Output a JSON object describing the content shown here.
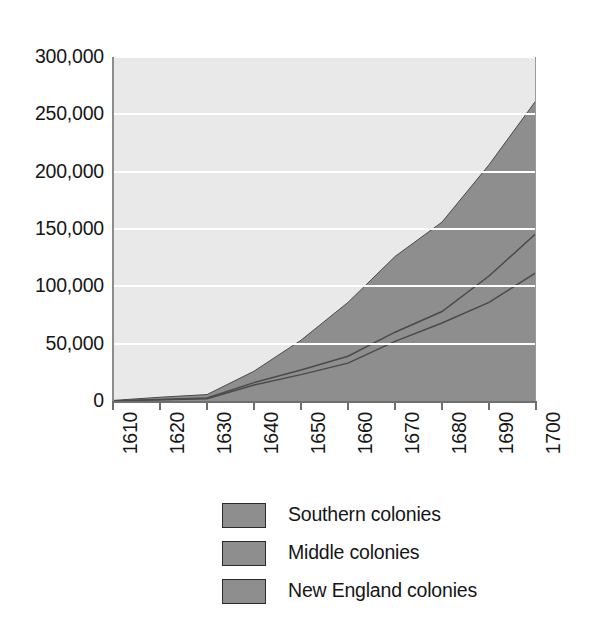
{
  "chart_data": {
    "type": "area",
    "stacked": true,
    "title": "",
    "xlabel": "",
    "ylabel": "",
    "grid": true,
    "legend_position": "bottom",
    "x": [
      1610,
      1620,
      1630,
      1640,
      1650,
      1660,
      1670,
      1680,
      1690,
      1700
    ],
    "xtick_labels": [
      "1610",
      "1620",
      "1630",
      "1640",
      "1650",
      "1660",
      "1670",
      "1680",
      "1690",
      "1700"
    ],
    "ytick_labels": [
      "0",
      "50,000",
      "100,000",
      "150,000",
      "200,000",
      "250,000",
      "300,000"
    ],
    "ytick_values": [
      0,
      50000,
      100000,
      150000,
      200000,
      250000,
      300000
    ],
    "ylim": [
      0,
      300000
    ],
    "xlim": [
      1610,
      1700
    ],
    "series": [
      {
        "name": "New England colonies",
        "color": "#8e8e8e",
        "values": [
          0,
          1000,
          2000,
          14000,
          23000,
          33000,
          52000,
          68000,
          86000,
          112000
        ]
      },
      {
        "name": "Middle colonies",
        "color": "#8e8e8e",
        "values": [
          0,
          300,
          600,
          2000,
          4000,
          6000,
          8000,
          10000,
          23000,
          34000
        ]
      },
      {
        "name": "Southern colonies",
        "color": "#8e8e8e",
        "values": [
          500,
          2000,
          3000,
          10000,
          26000,
          47000,
          66000,
          78000,
          97000,
          116000
        ]
      }
    ],
    "cumulative_boundaries": {
      "new_england": [
        0,
        1000,
        2000,
        14000,
        23000,
        33000,
        52000,
        68000,
        86000,
        112000
      ],
      "new_england_plus_middle": [
        0,
        1300,
        2600,
        16000,
        27000,
        39000,
        60000,
        78000,
        109000,
        146000
      ],
      "total": [
        500,
        3300,
        5600,
        26000,
        53000,
        86000,
        126000,
        156000,
        206000,
        262000
      ]
    },
    "background_color": "#e9e9e9",
    "gridline_color": "#ffffff",
    "boundary_line_color": "#4a4a4a"
  },
  "legend": {
    "items": [
      {
        "label": "Southern colonies",
        "color": "#8e8e8e"
      },
      {
        "label": "Middle colonies",
        "color": "#8e8e8e"
      },
      {
        "label": "New England colonies",
        "color": "#8e8e8e"
      }
    ]
  }
}
